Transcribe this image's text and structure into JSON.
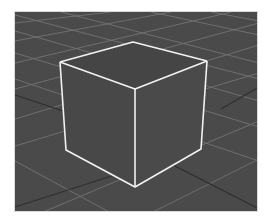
{
  "viewport": {
    "type": "3d-perspective-view",
    "background_color": "#4a4a4a",
    "grid": {
      "visible": true,
      "line_color": "#7a7a7a",
      "axis_line_color": "#2e2e2e"
    },
    "selected_object": {
      "name": "cube",
      "selected": true,
      "outline_color": "#f2f2f2",
      "face_color": "#474747"
    }
  }
}
